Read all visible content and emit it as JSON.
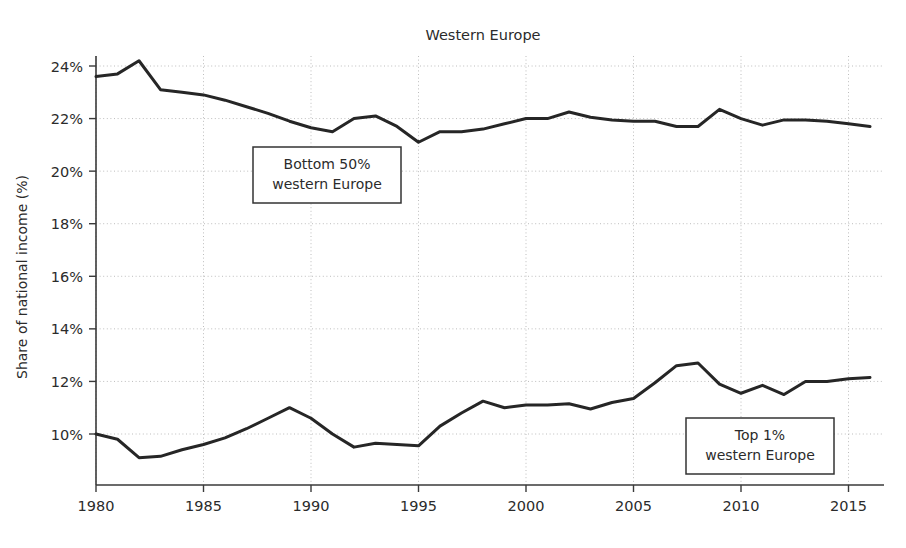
{
  "chart_data": {
    "type": "line",
    "title": "Western Europe",
    "xlabel": "",
    "ylabel": "Share of national income (%)",
    "xlim": [
      1980,
      2016
    ],
    "ylim": [
      9.0,
      24.6
    ],
    "grid": true,
    "legend_position": "inline-annotations",
    "yticks": [
      "10%",
      "12%",
      "14%",
      "16%",
      "18%",
      "20%",
      "22%",
      "24%"
    ],
    "ytick_values": [
      10,
      12,
      14,
      16,
      18,
      20,
      22,
      24
    ],
    "xticks": [
      "1980",
      "1985",
      "1990",
      "1995",
      "2000",
      "2005",
      "2010",
      "2015"
    ],
    "xtick_values": [
      1980,
      1985,
      1990,
      1995,
      2000,
      2005,
      2010,
      2015
    ],
    "x": [
      1980,
      1981,
      1982,
      1983,
      1984,
      1985,
      1986,
      1987,
      1988,
      1989,
      1990,
      1991,
      1992,
      1993,
      1994,
      1995,
      1996,
      1997,
      1998,
      1999,
      2000,
      2001,
      2002,
      2003,
      2004,
      2005,
      2006,
      2007,
      2008,
      2009,
      2010,
      2011,
      2012,
      2013,
      2014,
      2015,
      2016
    ],
    "series": [
      {
        "name": "Bottom 50% western Europe",
        "color": "#262626",
        "values": [
          23.6,
          23.7,
          24.2,
          23.1,
          23.0,
          22.9,
          22.7,
          22.45,
          22.2,
          21.9,
          21.65,
          21.5,
          22.0,
          22.1,
          21.7,
          21.1,
          21.5,
          21.5,
          21.6,
          21.8,
          22.0,
          22.0,
          22.25,
          22.05,
          21.95,
          21.9,
          21.9,
          21.7,
          21.7,
          22.35,
          22.0,
          21.75,
          21.95,
          21.95,
          21.9,
          21.8,
          21.7
        ]
      },
      {
        "name": "Top 1% western Europe",
        "color": "#262626",
        "values": [
          10.0,
          9.8,
          9.1,
          9.15,
          9.4,
          9.6,
          9.85,
          10.2,
          10.6,
          11.0,
          10.6,
          10.0,
          9.5,
          9.65,
          9.6,
          9.55,
          10.3,
          10.8,
          11.25,
          11.0,
          11.1,
          11.1,
          11.15,
          10.95,
          11.2,
          11.35,
          11.95,
          12.6,
          12.7,
          11.9,
          11.55,
          11.85,
          11.5,
          12.0,
          12.0,
          12.1,
          12.15
        ]
      }
    ],
    "annotations": [
      {
        "id": "bottom-50-label",
        "lines": [
          "Bottom 50%",
          "western Europe"
        ],
        "x_px": 253,
        "y_px": 147,
        "width_px": 148,
        "height_px": 56
      },
      {
        "id": "top-1-label",
        "lines": [
          "Top 1%",
          "western Europe"
        ],
        "x_px": 686,
        "y_px": 418,
        "width_px": 148,
        "height_px": 56
      }
    ]
  }
}
